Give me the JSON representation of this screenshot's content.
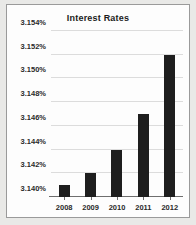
{
  "chart_data": {
    "type": "bar",
    "title": "Interest Rates",
    "xlabel": "",
    "ylabel": "",
    "categories": [
      "2008",
      "2009",
      "2010",
      "2011",
      "2012"
    ],
    "values": [
      3.141,
      3.142,
      3.144,
      3.147,
      3.152
    ],
    "value_labels": [
      "3.141%",
      "3.142%",
      "3.144%",
      "3.147%",
      "3.152%"
    ],
    "ylim": [
      3.14,
      3.154
    ],
    "ytick_values": [
      3.14,
      3.142,
      3.144,
      3.146,
      3.148,
      3.15,
      3.152,
      3.154
    ],
    "ytick_labels": [
      "3.140%",
      "3.142%",
      "3.144%",
      "3.146%",
      "3.148%",
      "3.150%",
      "3.152%",
      "3.154%"
    ],
    "grid": true,
    "legend": false,
    "legend_position": "none",
    "series_name": "Interest Rates",
    "bar_color": "#1e1e1e",
    "grid_color": "#dcdcdc",
    "axis_color": "#6e6e6e",
    "plot_background": "#fdfdfd",
    "page_background": "#e9e9e7"
  }
}
